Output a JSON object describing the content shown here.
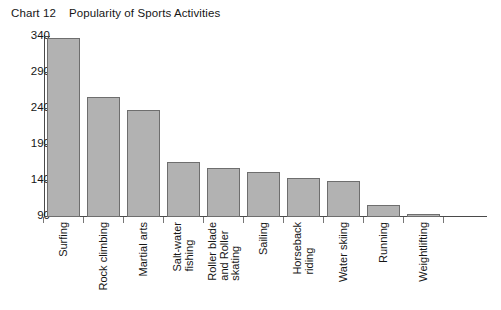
{
  "chart": {
    "title_number": "Chart 12",
    "title_text": "Popularity of Sports Activities"
  },
  "chart_data": {
    "type": "bar",
    "xlabel": "",
    "ylabel": "",
    "ylim": [
      90,
      340
    ],
    "yticks": [
      90,
      140,
      190,
      240,
      290,
      340
    ],
    "ytick_labels": [
      "90",
      "140",
      "190",
      "240",
      "290",
      "340"
    ],
    "grid": false,
    "legend": false,
    "bar_color": "#b2b2b2",
    "bar_edge_color": "#6e6e6e",
    "categories": [
      "Surfing",
      "Rock climbing",
      "Martial arts",
      "Salt-water fishing",
      "Roller blade and Roller skating",
      "Sailing",
      "Horseback riding",
      "Water skiing",
      "Running",
      "Weightlifting"
    ],
    "category_label_lines": [
      [
        "Surfing"
      ],
      [
        "Rock climbing"
      ],
      [
        "Martial arts"
      ],
      [
        "Salt-water",
        "fishing"
      ],
      [
        "Roller blade",
        "and Roller",
        "skating"
      ],
      [
        "Sailing"
      ],
      [
        "Horseback",
        "riding"
      ],
      [
        "Water skiing"
      ],
      [
        "Running"
      ],
      [
        "Weightlifting"
      ]
    ],
    "values": [
      338,
      257,
      238,
      167,
      158,
      153,
      144,
      140,
      106,
      94
    ]
  }
}
